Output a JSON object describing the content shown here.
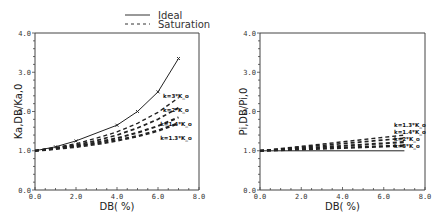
{
  "legend": {
    "ideal_label": "Ideal",
    "saturation_label": "Saturation"
  },
  "chart_data": [
    {
      "type": "line",
      "title": "",
      "xlabel": "DB( %)",
      "ylabel": "K_{a,DB}/K_{a,0}",
      "xlim": [
        0,
        8
      ],
      "ylim": [
        0,
        4
      ],
      "xticks": [
        "0.0",
        "2.0",
        "4.0",
        "6.0",
        "8.0"
      ],
      "yticks": [
        "0.0",
        "1.0",
        "2.0",
        "3.0",
        "4.0"
      ],
      "grid": false,
      "legend_position": "top-right (outside)",
      "series": [
        {
          "name": "Ideal",
          "style": "solid",
          "markers": true,
          "x": [
            0,
            1,
            2,
            4,
            5,
            6,
            7
          ],
          "y": [
            1.0,
            1.1,
            1.25,
            1.65,
            2.0,
            2.5,
            3.35
          ]
        },
        {
          "name": "k=3*K_o",
          "style": "dashed",
          "x": [
            0,
            1,
            2,
            3,
            4,
            5,
            6,
            7
          ],
          "y": [
            1.0,
            1.08,
            1.18,
            1.32,
            1.48,
            1.7,
            1.98,
            2.35
          ]
        },
        {
          "name": "k=2*K_o",
          "style": "dashed",
          "x": [
            0,
            1,
            2,
            3,
            4,
            5,
            6,
            7
          ],
          "y": [
            1.0,
            1.07,
            1.15,
            1.26,
            1.4,
            1.58,
            1.8,
            2.1
          ]
        },
        {
          "name": "k=1.4*K_o",
          "style": "dashed",
          "x": [
            0,
            1,
            2,
            3,
            4,
            5,
            6,
            7
          ],
          "y": [
            1.0,
            1.06,
            1.12,
            1.21,
            1.32,
            1.46,
            1.63,
            1.85
          ]
        },
        {
          "name": "k=1.3*K_o",
          "style": "dashed",
          "x": [
            0,
            1,
            2,
            3,
            4,
            5,
            6,
            7
          ],
          "y": [
            1.0,
            1.05,
            1.1,
            1.17,
            1.26,
            1.37,
            1.51,
            1.7
          ]
        }
      ],
      "annotations": [
        "k=3*K_o",
        "k=2*K_o",
        "k=1.4*K_o",
        "k=1.3*K_o"
      ]
    },
    {
      "type": "line",
      "title": "",
      "xlabel": "DB( %)",
      "ylabel": "P_{i,DB}/P_{i,0}",
      "xlim": [
        0,
        8
      ],
      "ylim": [
        0,
        4
      ],
      "xticks": [
        "0.0",
        "2.0",
        "4.0",
        "6.0",
        "8.0"
      ],
      "yticks": [
        "0.0",
        "1.0",
        "2.0",
        "3.0",
        "4.0"
      ],
      "grid": false,
      "series": [
        {
          "name": "Ideal",
          "style": "solid",
          "x": [
            0,
            7
          ],
          "y": [
            1.0,
            1.0
          ]
        },
        {
          "name": "k=1.3*K_o",
          "style": "dashed",
          "x": [
            0,
            7
          ],
          "y": [
            1.0,
            1.4
          ]
        },
        {
          "name": "k=1.4*K_o",
          "style": "dashed",
          "x": [
            0,
            7
          ],
          "y": [
            1.0,
            1.32
          ]
        },
        {
          "name": "k=2*K_o",
          "style": "dashed",
          "x": [
            0,
            7
          ],
          "y": [
            1.0,
            1.22
          ]
        },
        {
          "name": "k=3*K_o",
          "style": "dashed",
          "x": [
            0,
            7
          ],
          "y": [
            1.0,
            1.13
          ]
        }
      ],
      "annotations": [
        "k=1.3*K_o",
        "k=1.4*K_o",
        "k=2*K_o",
        "k=3*K_o"
      ]
    }
  ]
}
